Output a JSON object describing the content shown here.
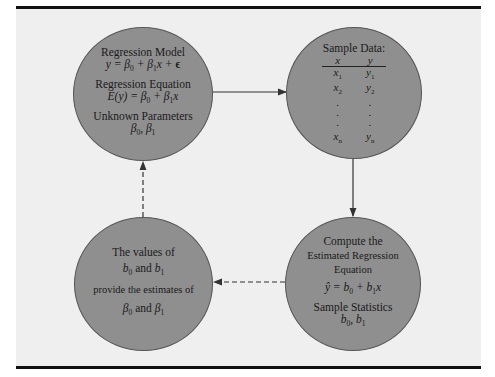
{
  "diagram": {
    "colors": {
      "panel": "#efefef",
      "circle": "#8f8f8f",
      "line": "#333333",
      "rule": "#111111"
    },
    "population_node": {
      "model_label": "Regression Model",
      "model_eq": "y = β0 + β1x + ϵ",
      "equation_label": "Regression Equation",
      "equation_eq": "E(y) = β0 + β1x",
      "params_label": "Unknown Parameters",
      "params": "β0, β1"
    },
    "sample_node": {
      "title": "Sample Data:",
      "headers": [
        "x",
        "y"
      ],
      "rows": [
        [
          "x1",
          "y1"
        ],
        [
          "x2",
          "y2"
        ],
        [
          ".",
          "."
        ],
        [
          ".",
          "."
        ],
        [
          ".",
          "."
        ],
        [
          "xn",
          "yn"
        ]
      ]
    },
    "compute_node": {
      "line1": "Compute the",
      "line2": "Estimated Regression",
      "line3": "Equation",
      "eq": "ŷ = b0 + b1x",
      "stats_label": "Sample Statistics",
      "stats": "b0, b1"
    },
    "estimates_node": {
      "line1": "The values of",
      "line2": "b0 and b1",
      "line3": "provide the estimates of",
      "line4": "β0 and β1"
    },
    "edges": [
      {
        "from": "population_node",
        "to": "sample_node",
        "style": "solid"
      },
      {
        "from": "sample_node",
        "to": "compute_node",
        "style": "solid"
      },
      {
        "from": "compute_node",
        "to": "estimates_node",
        "style": "dashed"
      },
      {
        "from": "estimates_node",
        "to": "population_node",
        "style": "dashed"
      }
    ]
  }
}
